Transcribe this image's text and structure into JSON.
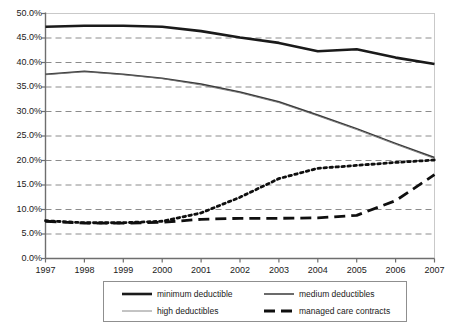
{
  "chart_data": {
    "type": "line",
    "title": "",
    "subtitle": "",
    "xlabel": "",
    "ylabel": "",
    "x": [
      1997,
      1998,
      1999,
      2000,
      2001,
      2002,
      2003,
      2004,
      2005,
      2006,
      2007
    ],
    "categories": [
      "1997",
      "1998",
      "1999",
      "2000",
      "2001",
      "2002",
      "2003",
      "2004",
      "2005",
      "2006",
      "2007"
    ],
    "xlim": [
      1997,
      2007
    ],
    "ylim": [
      0.0,
      50.0
    ],
    "ytick_labels": [
      "0.0%",
      "5.0%",
      "10.0%",
      "15.0%",
      "20.0%",
      "25.0%",
      "30.0%",
      "35.0%",
      "40.0%",
      "45.0%",
      "50.0%"
    ],
    "ytick_values": [
      0,
      5,
      10,
      15,
      20,
      25,
      30,
      35,
      40,
      45,
      50
    ],
    "grid": "horizontal-dashed",
    "legend_position": "bottom",
    "series": [
      {
        "name": "minimum deductible",
        "style": "solid-thick",
        "color": "#1a1a1a",
        "values": [
          47.3,
          47.5,
          47.5,
          47.3,
          46.4,
          45.1,
          44.0,
          42.3,
          42.7,
          41.0,
          39.7
        ]
      },
      {
        "name": "medium deductibles",
        "style": "solid-thin",
        "color": "#3a3a3a",
        "values": [
          37.6,
          38.2,
          37.6,
          36.8,
          35.6,
          34.0,
          32.0,
          29.3,
          26.5,
          23.5,
          20.6
        ]
      },
      {
        "name": "high deductibles",
        "style": "solid-hairline",
        "color": "#6b6b6b",
        "values": [
          37.5,
          38.1,
          37.5,
          36.7,
          35.4,
          33.8,
          31.8,
          29.1,
          26.3,
          23.3,
          20.4
        ]
      },
      {
        "name": "managed care contracts",
        "style": "dashed-thick",
        "color": "#0f0f0f",
        "values": [
          7.6,
          7.2,
          7.2,
          7.4,
          8.0,
          8.2,
          8.2,
          8.3,
          8.8,
          11.8,
          17.1
        ]
      },
      {
        "name": "dotted-series",
        "style": "dotted-thick",
        "color": "#0f0f0f",
        "hidden_from_legend": true,
        "values": [
          7.7,
          7.3,
          7.3,
          7.6,
          9.3,
          12.5,
          16.3,
          18.4,
          19.0,
          19.6,
          20.1
        ]
      }
    ]
  },
  "legend": {
    "entries": [
      {
        "label": "minimum deductible",
        "style": "solid-thick"
      },
      {
        "label": "medium deductibles",
        "style": "solid-thin"
      },
      {
        "label": "high deductibles",
        "style": "solid-hairline"
      },
      {
        "label": "managed care contracts",
        "style": "dashed-thick"
      }
    ]
  },
  "colors": {
    "axis": "#6e6e6e",
    "grid": "#8c8c8c",
    "plot_border": "#c9c9c9",
    "text": "#1a1a1a",
    "background": "#ffffff"
  }
}
